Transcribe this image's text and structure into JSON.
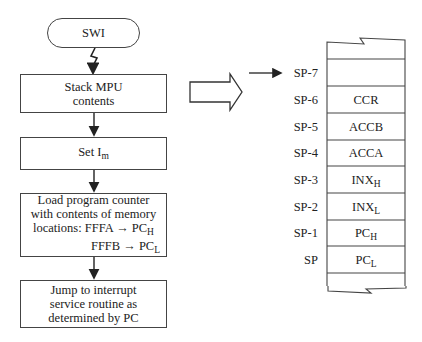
{
  "flowchart": {
    "start": "SWI",
    "steps": [
      {
        "line1": "Stack MPU",
        "line2": "contents"
      },
      {
        "text": "Set I",
        "sub": "m"
      },
      {
        "line1": "Load program counter",
        "line2": "with contents of memory",
        "line3_prefix": "locations: FFFA",
        "line3_target": "PC",
        "line3_sub": "H",
        "line4_prefix": "FFFB",
        "line4_target": "PC",
        "line4_sub": "L"
      },
      {
        "line1": "Jump to interrupt",
        "line2": "service routine as",
        "line3": "determined by PC"
      }
    ]
  },
  "stack": {
    "rows": [
      {
        "label": "SP-7",
        "content": "",
        "sub": ""
      },
      {
        "label": "SP-6",
        "content": "CCR",
        "sub": ""
      },
      {
        "label": "SP-5",
        "content": "ACCB",
        "sub": ""
      },
      {
        "label": "SP-4",
        "content": "ACCA",
        "sub": ""
      },
      {
        "label": "SP-3",
        "content": "INX",
        "sub": "H"
      },
      {
        "label": "SP-2",
        "content": "INX",
        "sub": "L"
      },
      {
        "label": "SP-1",
        "content": "PC",
        "sub": "H"
      },
      {
        "label": "SP",
        "content": "PC",
        "sub": "L"
      }
    ]
  },
  "arrow_glyph": "→"
}
